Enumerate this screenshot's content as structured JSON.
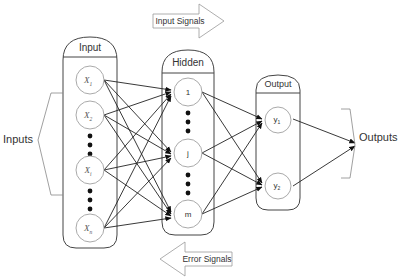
{
  "diagram": {
    "input_signals_label": "Input Signals",
    "error_signals_label": "Error Signals",
    "inputs_label": "Inputs",
    "outputs_label": "Outputs",
    "layers": {
      "input": {
        "title": "Input",
        "nodes": [
          "X1",
          "X2",
          "Xi",
          "Xn"
        ],
        "node_main": [
          "X",
          "X",
          "X",
          "X"
        ],
        "node_sub": [
          "1",
          "2",
          "i",
          "n"
        ]
      },
      "hidden": {
        "title": "Hidden",
        "nodes": [
          "1",
          "j",
          "m"
        ]
      },
      "output": {
        "title": "Output",
        "node_main": [
          "y",
          "y"
        ],
        "node_sub": [
          "1",
          "2"
        ]
      }
    },
    "colors": {
      "stroke": "#444444",
      "node_stroke": "#aaaaaa",
      "text": "#333333",
      "background": "#ffffff"
    }
  }
}
